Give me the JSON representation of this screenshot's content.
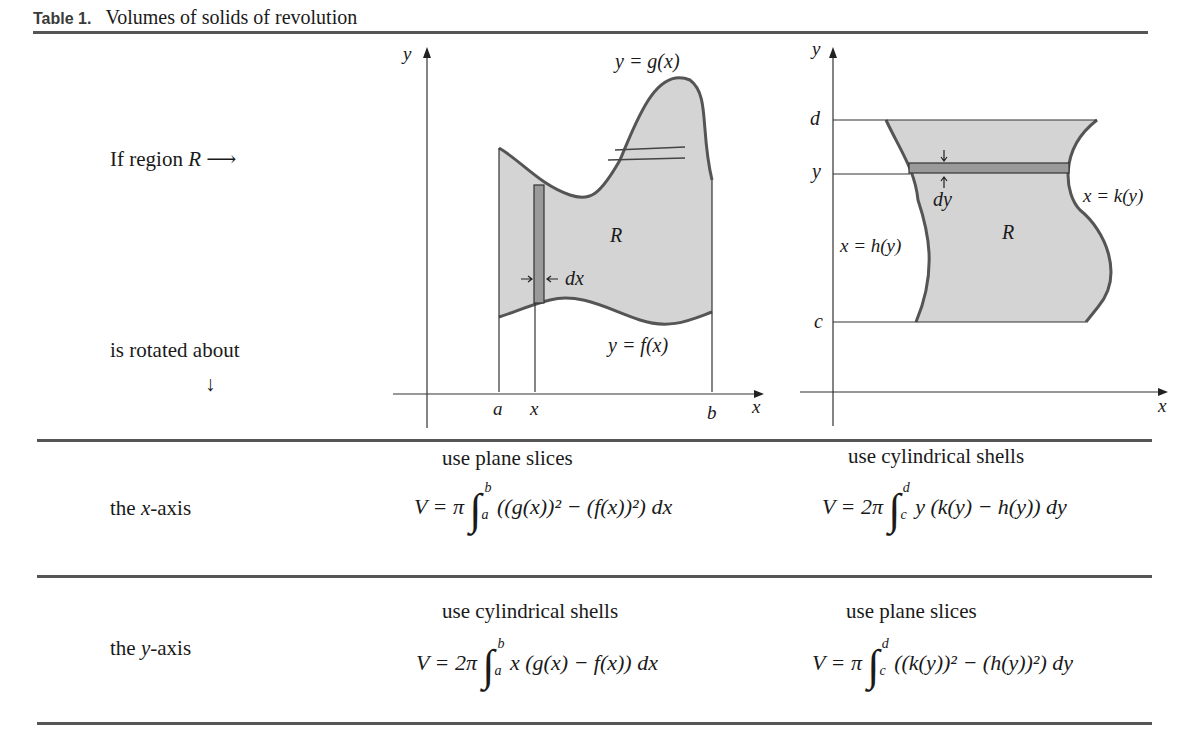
{
  "caption": {
    "label": "Table 1.",
    "title": "Volumes of solids of revolution"
  },
  "left_column": {
    "if_region": "If region",
    "region_symbol": "R",
    "right_arrow": "⟶",
    "is_rotated_about": "is rotated about",
    "down_arrow": "↓"
  },
  "figure_x": {
    "y_axis_label": "y",
    "x_axis_label": "x",
    "upper_curve_label": "y = g(x)",
    "lower_curve_label": "y = f(x)",
    "region_label": "R",
    "strip_width_label": "dx",
    "tick_a": "a",
    "tick_x": "x",
    "tick_b": "b"
  },
  "figure_y": {
    "y_axis_label": "y",
    "x_axis_label": "x",
    "left_curve_label": "x = h(y)",
    "right_curve_label": "x = k(y)",
    "region_label": "R",
    "strip_height_label": "dy",
    "tick_d": "d",
    "tick_y": "y",
    "tick_c": "c"
  },
  "rows": [
    {
      "axis_prefix": "the ",
      "axis_var": "x",
      "axis_suffix": "-axis",
      "col1": {
        "method": "use plane slices",
        "formula_lhs": "V = π",
        "upper": "b",
        "lower": "a",
        "integrand": "((g(x))² − (f(x))²) dx"
      },
      "col2": {
        "method": "use cylindrical shells",
        "formula_lhs": "V = 2π",
        "upper": "d",
        "lower": "c",
        "integrand": "y (k(y) − h(y)) dy"
      }
    },
    {
      "axis_prefix": "the ",
      "axis_var": "y",
      "axis_suffix": "-axis",
      "col1": {
        "method": "use cylindrical shells",
        "formula_lhs": "V = 2π",
        "upper": "b",
        "lower": "a",
        "integrand": "x (g(x) − f(x)) dx"
      },
      "col2": {
        "method": "use plane slices",
        "formula_lhs": "V = π",
        "upper": "d",
        "lower": "c",
        "integrand": "((k(y))² − (h(y))²) dy"
      }
    }
  ],
  "colors": {
    "rule": "#555555",
    "region_fill": "#d4d4d4",
    "strip_fill": "#9a9a9a",
    "curve": "#555555"
  }
}
